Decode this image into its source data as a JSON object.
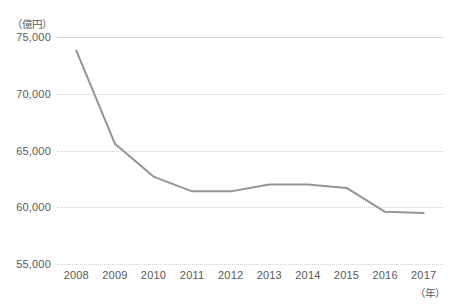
{
  "chart_data": {
    "type": "line",
    "title": "",
    "subtitle": "",
    "xlabel": "（年）",
    "ylabel": "（億円）",
    "categories": [
      "2008",
      "2009",
      "2010",
      "2011",
      "2012",
      "2013",
      "2014",
      "2015",
      "2016",
      "2017"
    ],
    "values": [
      73800,
      65600,
      62700,
      61400,
      61400,
      62000,
      62000,
      61700,
      59600,
      59500
    ],
    "series": [
      {
        "name": "",
        "values": [
          73800,
          65600,
          62700,
          61400,
          61400,
          62000,
          62000,
          61700,
          59600,
          59500
        ]
      }
    ],
    "ylim": [
      55000,
      75000
    ],
    "yticks": [
      55000,
      60000,
      65000,
      70000,
      75000
    ],
    "ytick_labels": [
      "55,000",
      "60,000",
      "65,000",
      "70,000",
      "75,000"
    ],
    "grid": true,
    "grid_axis": "y",
    "legend": false,
    "legend_position": "none",
    "line_color": "#949494",
    "grid_color": "#d2d2d2",
    "text_color": "#58595b",
    "background_color": "#ffffff",
    "markers": false,
    "annotations": []
  },
  "axes": {
    "y_unit_label": "（億円）",
    "x_unit_label": "（年）"
  }
}
